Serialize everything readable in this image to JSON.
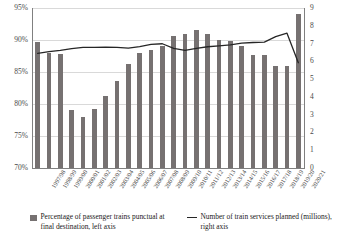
{
  "chart_data": {
    "type": "bar",
    "title": "",
    "xlabel": "",
    "ylabel": "",
    "grid": true,
    "legend_position": "bottom",
    "categories": [
      "1997/98",
      "1998/99",
      "1999/00",
      "2000/01",
      "2001/02",
      "2002/03",
      "2003/04",
      "2004/05",
      "2005/06",
      "2006/07",
      "2007/08",
      "2008/09",
      "2009/10",
      "2010/11",
      "2011/12",
      "2012/13",
      "2013/14",
      "2014/15",
      "2015/16",
      "2016/17",
      "2017/18",
      "2018/19",
      "2019/20",
      "2020/21"
    ],
    "left_axis": {
      "label": "Percentage of passenger trains punctual at final destination",
      "ticks": [
        "70%",
        "75%",
        "80%",
        "85%",
        "90%",
        "95%"
      ],
      "tick_values": [
        70,
        75,
        80,
        85,
        90,
        95
      ],
      "ylim": [
        70,
        95
      ],
      "format": "percent"
    },
    "right_axis": {
      "label": "Number of train services planned (millions)",
      "ticks": [
        "0",
        "1",
        "2",
        "3",
        "4",
        "5",
        "6",
        "7",
        "8",
        "9"
      ],
      "tick_values": [
        0,
        1,
        2,
        3,
        4,
        5,
        6,
        7,
        8,
        9
      ],
      "ylim": [
        0,
        9
      ],
      "format": "millions"
    },
    "series": [
      {
        "name": "Percentage of passenger trains punctual at final destination, left axis",
        "type": "bar",
        "axis": "left",
        "color": "#767171",
        "values": [
          89.7,
          87.9,
          87.8,
          79.1,
          78.0,
          79.2,
          81.2,
          83.6,
          86.3,
          88.0,
          88.4,
          89.1,
          90.6,
          90.9,
          91.5,
          90.9,
          90.0,
          89.9,
          89.1,
          87.7,
          87.6,
          86.0,
          86.0,
          94.0
        ]
      },
      {
        "name": "Number of train services planned (millions), right axis",
        "type": "line",
        "axis": "right",
        "color": "#262626",
        "values": [
          6.45,
          6.55,
          6.62,
          6.72,
          6.78,
          6.79,
          6.8,
          6.78,
          6.74,
          6.83,
          6.95,
          6.99,
          6.73,
          6.62,
          6.73,
          6.82,
          6.87,
          6.93,
          7.02,
          7.06,
          7.08,
          7.39,
          7.58,
          5.92
        ]
      }
    ]
  },
  "legend": {
    "items": [
      {
        "marker": "bar-swatch",
        "label": "Percentage of passenger trains punctual at final destination, left axis"
      },
      {
        "marker": "line-swatch",
        "label": "Number of train services planned (millions), right axis"
      }
    ]
  }
}
